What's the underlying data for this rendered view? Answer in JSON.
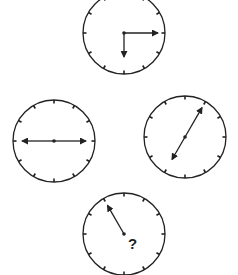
{
  "puzzle": {
    "clocks": [
      {
        "id": "top",
        "cx": 124,
        "cy": 33,
        "r": 41,
        "hands": [
          {
            "angle": 90,
            "length": 34,
            "arrow": true
          },
          {
            "angle": 180,
            "length": 24,
            "arrow": true
          }
        ]
      },
      {
        "id": "left",
        "cx": 54,
        "cy": 141,
        "r": 41,
        "hands": [
          {
            "angle": 90,
            "length": 32,
            "arrow": true
          },
          {
            "angle": 270,
            "length": 32,
            "arrow": true
          }
        ]
      },
      {
        "id": "right",
        "cx": 185,
        "cy": 137,
        "r": 41,
        "hands": [
          {
            "angle": 30,
            "length": 34,
            "arrow": true
          },
          {
            "angle": 210,
            "length": 26,
            "arrow": true
          }
        ]
      },
      {
        "id": "bottom",
        "cx": 124,
        "cy": 234,
        "r": 41,
        "hands": [
          {
            "angle": 330,
            "length": 33,
            "arrow": true
          }
        ]
      }
    ],
    "question_mark": {
      "text": "?",
      "x": 128,
      "y": 236
    },
    "colors": {
      "stroke": "#222222",
      "background": "#ffffff"
    }
  }
}
